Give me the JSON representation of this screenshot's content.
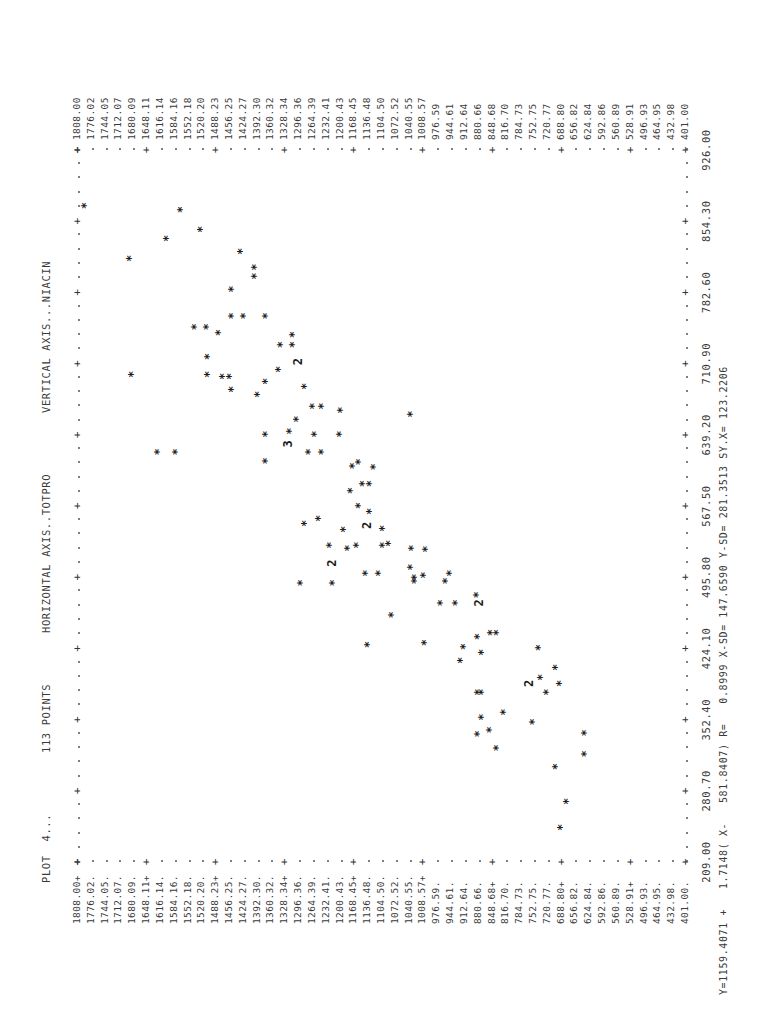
{
  "header": {
    "plot_label": "PLOT  4...",
    "points_label": "113 POINTS",
    "horizontal_axis": "HORIZONTAL AXIS..TOTPRO",
    "vertical_axis": "VERTICAL AXIS...NIACIN"
  },
  "footer": {
    "regression": "Y=1159.4071 +   1.7148( X-   581.8407) R=   0.8999 X-SD= 147.6590 Y-SD= 281.3513 SY.X= 123.2206"
  },
  "chart_data": {
    "type": "scatter",
    "title": "PLOT 4... 113 POINTS",
    "xlabel": "TOTPRO",
    "ylabel": "NIACIN",
    "xlim": [
      209.0,
      926.0
    ],
    "ylim": [
      401.0,
      1808.0
    ],
    "x_ticks": [
      "209.00",
      "280.70",
      "352.40",
      "424.10",
      "495.80",
      "567.50",
      "639.20",
      "710.90",
      "782.60",
      "854.30",
      "926.00"
    ],
    "y_ticks": [
      "1808.00",
      "1776.02",
      "1744.05",
      "1712.07",
      "1680.09",
      "1648.11",
      "1616.14",
      "1584.16",
      "1552.18",
      "1520.20",
      "1488.23",
      "1456.25",
      "1424.27",
      "1392.30",
      "1360.32",
      "1328.34",
      "1296.36",
      "1264.39",
      "1232.41",
      "1200.43",
      "1168.45",
      "1136.48",
      "1104.50",
      "1072.52",
      "1040.55",
      "1008.57",
      "976.59",
      "944.61",
      "912.64",
      "880.66",
      "848.68",
      "816.70",
      "784.73",
      "752.75",
      "720.77",
      "688.80",
      "656.82",
      "624.84",
      "592.86",
      "560.89",
      "528.91",
      "496.93",
      "464.95",
      "432.98",
      "401.00"
    ],
    "y_tick_markers": {
      "528.91": "P",
      "1744.05": "P"
    },
    "grid": false,
    "legend": null,
    "regression": {
      "intercept": 1159.4071,
      "slope": 1.7148,
      "x_mean": 581.8407,
      "r": 0.8999,
      "x_sd": 147.659,
      "y_sd": 281.3513,
      "sy_x": 123.2206
    },
    "point_count": 113,
    "symbols_note": "* = 1 point, 2/3 = multiple coincident points",
    "points": [
      {
        "x": 870,
        "y": 1790,
        "s": "*"
      },
      {
        "x": 866,
        "y": 1568,
        "s": "*"
      },
      {
        "x": 837,
        "y": 1600,
        "s": "*"
      },
      {
        "x": 846,
        "y": 1522,
        "s": "*"
      },
      {
        "x": 817,
        "y": 1685,
        "s": "*"
      },
      {
        "x": 824,
        "y": 1428,
        "s": "*"
      },
      {
        "x": 799,
        "y": 1395,
        "s": "*"
      },
      {
        "x": 808,
        "y": 1395,
        "s": "*"
      },
      {
        "x": 786,
        "y": 1450,
        "s": "*"
      },
      {
        "x": 759,
        "y": 1450,
        "s": "*"
      },
      {
        "x": 759,
        "y": 1422,
        "s": "*"
      },
      {
        "x": 759,
        "y": 1370,
        "s": "*"
      },
      {
        "x": 748,
        "y": 1534,
        "s": "*"
      },
      {
        "x": 748,
        "y": 1508,
        "s": "*"
      },
      {
        "x": 742,
        "y": 1480,
        "s": "*"
      },
      {
        "x": 730,
        "y": 1335,
        "s": "*"
      },
      {
        "x": 730,
        "y": 1307,
        "s": "*"
      },
      {
        "x": 740,
        "y": 1308,
        "s": "*"
      },
      {
        "x": 718,
        "y": 1505,
        "s": "*"
      },
      {
        "x": 705,
        "y": 1340,
        "s": "*"
      },
      {
        "x": 693,
        "y": 1370,
        "s": "*"
      },
      {
        "x": 688,
        "y": 1280,
        "s": "*"
      },
      {
        "x": 700,
        "y": 1505,
        "s": "*"
      },
      {
        "x": 698,
        "y": 1470,
        "s": "*"
      },
      {
        "x": 698,
        "y": 1453,
        "s": "*"
      },
      {
        "x": 700,
        "y": 1680,
        "s": "*"
      },
      {
        "x": 713,
        "y": 1300,
        "s": "2"
      },
      {
        "x": 685,
        "y": 1450,
        "s": "*"
      },
      {
        "x": 680,
        "y": 1390,
        "s": "*"
      },
      {
        "x": 668,
        "y": 1262,
        "s": "*"
      },
      {
        "x": 668,
        "y": 1240,
        "s": "*"
      },
      {
        "x": 664,
        "y": 1197,
        "s": "*"
      },
      {
        "x": 655,
        "y": 1300,
        "s": "*"
      },
      {
        "x": 660,
        "y": 1035,
        "s": "*"
      },
      {
        "x": 643,
        "y": 1316,
        "s": "*"
      },
      {
        "x": 640,
        "y": 1257,
        "s": "*"
      },
      {
        "x": 640,
        "y": 1200,
        "s": "*"
      },
      {
        "x": 640,
        "y": 1370,
        "s": "*"
      },
      {
        "x": 630,
        "y": 1322,
        "s": "3"
      },
      {
        "x": 622,
        "y": 1270,
        "s": "*"
      },
      {
        "x": 622,
        "y": 1242,
        "s": "*"
      },
      {
        "x": 622,
        "y": 1580,
        "s": "*"
      },
      {
        "x": 622,
        "y": 1620,
        "s": "*"
      },
      {
        "x": 613,
        "y": 1370,
        "s": "*"
      },
      {
        "x": 612,
        "y": 1155,
        "s": "*"
      },
      {
        "x": 608,
        "y": 1170,
        "s": "*"
      },
      {
        "x": 607,
        "y": 1120,
        "s": "*"
      },
      {
        "x": 590,
        "y": 1130,
        "s": "*"
      },
      {
        "x": 590,
        "y": 1145,
        "s": "*"
      },
      {
        "x": 583,
        "y": 1175,
        "s": "*"
      },
      {
        "x": 568,
        "y": 1155,
        "s": "*"
      },
      {
        "x": 562,
        "y": 1130,
        "s": "*"
      },
      {
        "x": 555,
        "y": 1248,
        "s": "*"
      },
      {
        "x": 550,
        "y": 1280,
        "s": "*"
      },
      {
        "x": 548,
        "y": 1140,
        "s": "2"
      },
      {
        "x": 545,
        "y": 1100,
        "s": "*"
      },
      {
        "x": 544,
        "y": 1190,
        "s": "*"
      },
      {
        "x": 530,
        "y": 1085,
        "s": "*"
      },
      {
        "x": 528,
        "y": 1160,
        "s": "*"
      },
      {
        "x": 528,
        "y": 1222,
        "s": "*"
      },
      {
        "x": 528,
        "y": 1100,
        "s": "*"
      },
      {
        "x": 524,
        "y": 1000,
        "s": "*"
      },
      {
        "x": 525,
        "y": 1032,
        "s": "*"
      },
      {
        "x": 525,
        "y": 1180,
        "s": "*"
      },
      {
        "x": 510,
        "y": 1220,
        "s": "2"
      },
      {
        "x": 506,
        "y": 1035,
        "s": "*"
      },
      {
        "x": 500,
        "y": 1140,
        "s": "*"
      },
      {
        "x": 500,
        "y": 1110,
        "s": "*"
      },
      {
        "x": 498,
        "y": 1005,
        "s": "*"
      },
      {
        "x": 496,
        "y": 1025,
        "s": "*"
      },
      {
        "x": 500,
        "y": 945,
        "s": "*"
      },
      {
        "x": 492,
        "y": 1025,
        "s": "*"
      },
      {
        "x": 492,
        "y": 955,
        "s": "*"
      },
      {
        "x": 490,
        "y": 1290,
        "s": "*"
      },
      {
        "x": 490,
        "y": 1215,
        "s": "*"
      },
      {
        "x": 478,
        "y": 882,
        "s": "*"
      },
      {
        "x": 470,
        "y": 932,
        "s": "*"
      },
      {
        "x": 470,
        "y": 880,
        "s": "2"
      },
      {
        "x": 470,
        "y": 965,
        "s": "*"
      },
      {
        "x": 458,
        "y": 1080,
        "s": "*"
      },
      {
        "x": 440,
        "y": 850,
        "s": "*"
      },
      {
        "x": 440,
        "y": 835,
        "s": "*"
      },
      {
        "x": 436,
        "y": 880,
        "s": "*"
      },
      {
        "x": 430,
        "y": 1003,
        "s": "*"
      },
      {
        "x": 428,
        "y": 1135,
        "s": "*"
      },
      {
        "x": 426,
        "y": 913,
        "s": "*"
      },
      {
        "x": 425,
        "y": 740,
        "s": "*"
      },
      {
        "x": 420,
        "y": 870,
        "s": "*"
      },
      {
        "x": 412,
        "y": 920,
        "s": "*"
      },
      {
        "x": 405,
        "y": 700,
        "s": "*"
      },
      {
        "x": 395,
        "y": 735,
        "s": "*"
      },
      {
        "x": 389,
        "y": 765,
        "s": "2"
      },
      {
        "x": 389,
        "y": 690,
        "s": "*"
      },
      {
        "x": 380,
        "y": 880,
        "s": "*"
      },
      {
        "x": 380,
        "y": 870,
        "s": "*"
      },
      {
        "x": 380,
        "y": 720,
        "s": "*"
      },
      {
        "x": 360,
        "y": 820,
        "s": "*"
      },
      {
        "x": 350,
        "y": 752,
        "s": "*"
      },
      {
        "x": 355,
        "y": 870,
        "s": "*"
      },
      {
        "x": 342,
        "y": 853,
        "s": "*"
      },
      {
        "x": 339,
        "y": 633,
        "s": "*"
      },
      {
        "x": 338,
        "y": 880,
        "s": "*"
      },
      {
        "x": 324,
        "y": 835,
        "s": "*"
      },
      {
        "x": 318,
        "y": 633,
        "s": "*"
      },
      {
        "x": 305,
        "y": 700,
        "s": "*"
      },
      {
        "x": 270,
        "y": 674,
        "s": "*"
      },
      {
        "x": 244,
        "y": 687,
        "s": "*"
      }
    ]
  }
}
